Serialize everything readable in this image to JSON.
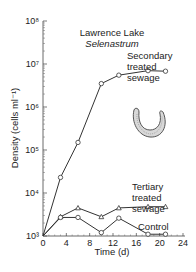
{
  "chart_data": {
    "type": "line",
    "title": "Lawrence Lake",
    "subtitle": "Selenastrum",
    "xlabel": "Time (d)",
    "ylabel": "Density (cells ml⁻¹)",
    "xlim": [
      0,
      24
    ],
    "ylim": [
      1000,
      100000000
    ],
    "yscale": "log",
    "x_ticks": [
      0,
      4,
      8,
      12,
      16,
      20,
      24
    ],
    "y_ticks": [
      1000,
      10000,
      100000,
      1000000,
      10000000,
      100000000
    ],
    "y_tick_labels": [
      "10³",
      "10⁴",
      "10⁵",
      "10⁶",
      "10⁷",
      "10⁸"
    ],
    "grid": false,
    "legend": "inline labels",
    "series": [
      {
        "name": "Secondary treated sewage",
        "marker": "circle",
        "x": [
          0,
          3,
          6,
          10,
          13,
          18,
          21
        ],
        "values": [
          1000,
          23000,
          150000,
          3500000,
          5500000,
          7000000,
          6800000
        ]
      },
      {
        "name": "Tertiary treated sewage",
        "marker": "triangle",
        "x": [
          0,
          3,
          6,
          10,
          13,
          18,
          21
        ],
        "values": [
          1000,
          2800,
          4500,
          2800,
          4500,
          4800,
          4800
        ]
      },
      {
        "name": "Control",
        "marker": "circle",
        "x": [
          0,
          3,
          6,
          10,
          13,
          18,
          21
        ],
        "values": [
          1000,
          2700,
          2700,
          1200,
          2600,
          1100,
          1100
        ]
      }
    ],
    "annotations": [
      {
        "text": "Secondary treated sewage",
        "lines": [
          "Secondary",
          "treated",
          "sewage"
        ]
      },
      {
        "text": "Tertiary treated sewage",
        "lines": [
          "Tertiary",
          "treated",
          "sewage"
        ]
      },
      {
        "text": "Control",
        "lines": [
          "Control"
        ]
      },
      {
        "text": "Selenastrum cell illustration (crescent)"
      }
    ]
  },
  "labels": {
    "title": "Lawrence Lake",
    "subtitle": "Selenastrum",
    "xlabel": "Time (d)",
    "ylabel": "Density (cells ml⁻¹)",
    "secondary": [
      "Secondary",
      "treated",
      "sewage"
    ],
    "tertiary": [
      "Tertiary",
      "treated",
      "sewage"
    ],
    "control": "Control"
  }
}
